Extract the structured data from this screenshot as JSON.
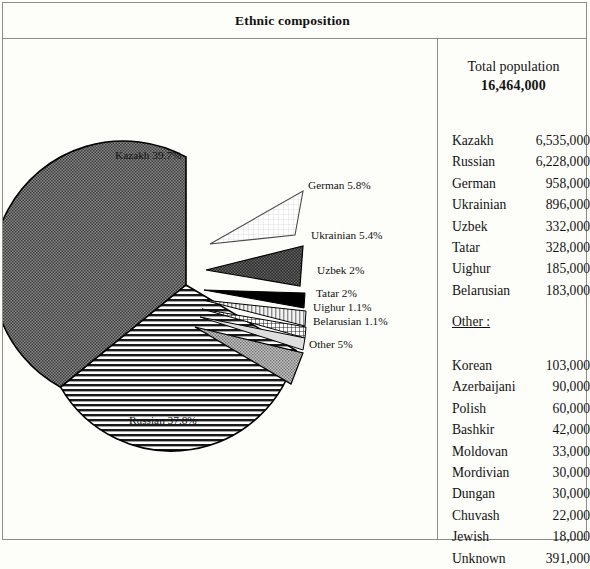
{
  "title": "Ethnic composition",
  "panel": {
    "total_label": "Total population",
    "total_value": "16,464,000",
    "other_heading": "Other :",
    "main_groups": [
      {
        "name": "Kazakh",
        "value": "6,535,000"
      },
      {
        "name": "Russian",
        "value": "6,228,000"
      },
      {
        "name": "German",
        "value": "958,000"
      },
      {
        "name": "Ukrainian",
        "value": "896,000"
      },
      {
        "name": "Uzbek",
        "value": "332,000"
      },
      {
        "name": "Tatar",
        "value": "328,000"
      },
      {
        "name": "Uighur",
        "value": "185,000"
      },
      {
        "name": "Belarusian",
        "value": "183,000"
      }
    ],
    "other_groups": [
      {
        "name": "Korean",
        "value": "103,000"
      },
      {
        "name": "Azerbaijani",
        "value": "90,000"
      },
      {
        "name": "Polish",
        "value": "60,000"
      },
      {
        "name": "Bashkir",
        "value": "42,000"
      },
      {
        "name": "Moldovan",
        "value": "33,000"
      },
      {
        "name": "Mordivian",
        "value": "30,000"
      },
      {
        "name": "Dungan",
        "value": "30,000"
      },
      {
        "name": "Chuvash",
        "value": "22,000"
      },
      {
        "name": "Jewish",
        "value": "18,000"
      },
      {
        "name": "Unknown",
        "value": "391,000"
      }
    ]
  },
  "chart_data": {
    "type": "pie",
    "title": "Ethnic composition",
    "legend": "none",
    "value_unit": "percent",
    "labels": [
      "Kazakh 39.7%",
      "German 5.8%",
      "Ukrainian 5.4%",
      "Uzbek 2%",
      "Tatar 2%",
      "Uighur 1.1%",
      "Belarusian 1.1%",
      "Other 5%",
      "Russian 37.8%"
    ],
    "categories": [
      "Kazakh",
      "German",
      "Ukrainian",
      "Uzbek",
      "Tatar",
      "Uighur",
      "Belarusian",
      "Other",
      "Russian"
    ],
    "values": [
      39.7,
      5.8,
      5.4,
      2.0,
      2.0,
      1.1,
      1.1,
      5.0,
      37.8
    ],
    "slice_labels": {
      "kazakh": "Kazakh 39.7%",
      "german": "German 5.8%",
      "ukrainian": "Ukrainian 5.4%",
      "uzbek": "Uzbek 2%",
      "tatar": "Tatar 2%",
      "uighur": "Uighur 1.1%",
      "belarusian": "Belarusian 1.1%",
      "other": "Other 5%",
      "russian": "Russian 37.8%"
    },
    "exploded": [
      "German",
      "Ukrainian",
      "Uzbek",
      "Tatar",
      "Uighur",
      "Belarusian",
      "Other"
    ],
    "colors": {
      "kazakh": "#6d6d6d",
      "german": "#ffffff",
      "ukrainian": "#3a3a3a",
      "uzbek": "#000000",
      "tatar": "#e2e2e2",
      "uighur": "#c9c9c9",
      "belarusian": "#dcdcdc",
      "other": "#a8a8a8",
      "russian": "#d8d8d8",
      "outline": "#000000"
    }
  }
}
